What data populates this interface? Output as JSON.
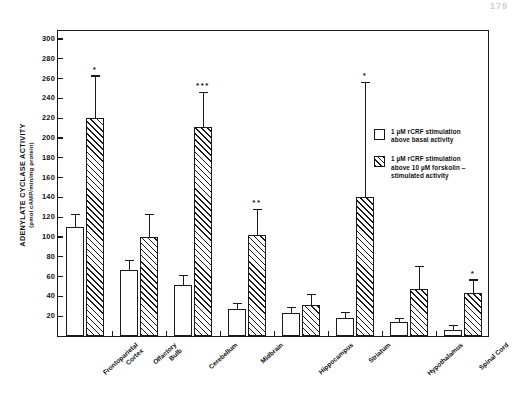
{
  "page_number": "179",
  "chart_data": {
    "type": "bar",
    "title": "",
    "xlabel": "",
    "ylabel": "ADENYLATE CYCLASE ACTIVITY",
    "ylabel_units": "(pmol cAMP/min/mg protein)",
    "ylim": [
      0,
      310
    ],
    "ytick_step": 20,
    "yticks": [
      20,
      40,
      60,
      80,
      100,
      120,
      140,
      160,
      180,
      200,
      220,
      240,
      260,
      280,
      300
    ],
    "grid": false,
    "legend_position": "right-inside",
    "categories": [
      "Frontoparietal\nCortex",
      "Olfactory\nBulb",
      "Cerebellum",
      "Midbrain",
      "Hippocampus",
      "Striatum",
      "Hypothalamus",
      "Spinal Cord"
    ],
    "series": [
      {
        "name": "1 µM rCRF stimulation above basal activity",
        "fill": "open",
        "values": [
          110,
          67,
          52,
          27,
          23,
          18,
          14,
          6
        ],
        "errors": [
          12,
          9,
          9,
          5,
          5,
          5,
          3,
          4
        ],
        "significance": [
          "",
          "",
          "",
          "",
          "",
          "",
          "",
          ""
        ]
      },
      {
        "name": "1 µM rCRF stimulation above 10 µM forskolin-stimulated activity",
        "fill": "hatched",
        "values": [
          220,
          100,
          211,
          102,
          31,
          140,
          47,
          43
        ],
        "errors": [
          42,
          22,
          34,
          25,
          10,
          115,
          23,
          13
        ],
        "significance": [
          "*",
          "",
          "***",
          "**",
          "",
          "*",
          "",
          "*"
        ]
      }
    ]
  },
  "legend": {
    "entries": [
      {
        "swatch": "open-square",
        "lines": [
          "1 µM rCRF stimulation",
          "above basal activity"
        ]
      },
      {
        "swatch": "hatched-square",
        "lines": [
          "1 µM rCRF stimulation",
          "above 10 µM forskolin –",
          "stimulated activity"
        ]
      }
    ]
  }
}
